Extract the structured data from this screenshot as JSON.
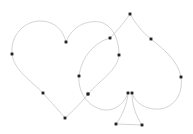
{
  "canvas": {
    "width": 193,
    "height": 134,
    "background": "#ffffff",
    "stroke_color": "#c8c8c8",
    "anchor_color": "#222222"
  },
  "shapes": [
    {
      "name": "heart",
      "d": "M65,118 C55,106 48,99 43,93 C30,80 14,70 12,54 C10,35 25,20 42,21 C55,22 63,30 66,42 C72,27 85,20 100,22 C112,25 119,38 119,55 C118,70 100,80 88,94 C80,104 72,112 65,118 Z",
      "anchors": [
        [
          12,
          54
        ],
        [
          66,
          42
        ],
        [
          43,
          93
        ],
        [
          65,
          118
        ],
        [
          119,
          55
        ],
        [
          88,
          94
        ]
      ]
    },
    {
      "name": "spade",
      "d": "M130,14 C123,24 116,32 110,38 C96,42 82,55 79,76 C78,90 85,104 100,109 C112,113 124,105 128,93 C127,105 122,116 116,124 L142,125 C136,116 132,105 132,93 C136,105 150,112 165,108 C178,103 183,90 181,77 C178,60 162,48 151,39 C142,32 136,24 130,14 Z",
      "anchors": [
        [
          130,
          14
        ],
        [
          110,
          38
        ],
        [
          151,
          39
        ],
        [
          181,
          77
        ],
        [
          79,
          76
        ],
        [
          88,
          94
        ],
        [
          128,
          93
        ],
        [
          132,
          93
        ],
        [
          116,
          124
        ],
        [
          142,
          125
        ]
      ]
    }
  ]
}
